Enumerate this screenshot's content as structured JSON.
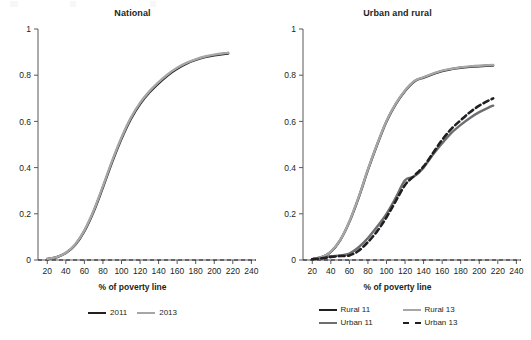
{
  "figure": {
    "background": "#ffffff",
    "text_color": "#231f20"
  },
  "panels": [
    {
      "id": "national",
      "title": "National",
      "xlabel": "% of poverty line",
      "legend": [
        {
          "label": "2011",
          "color": "#231f20",
          "style": "solid"
        },
        {
          "label": "2013",
          "color": "#a6a6a6",
          "style": "solid"
        }
      ]
    },
    {
      "id": "urban-and-rural",
      "title": "Urban and rural",
      "xlabel": "% of poverty line",
      "legend": [
        {
          "label": "Rural 11",
          "color": "#231f20",
          "style": "solid"
        },
        {
          "label": "Rural 13",
          "color": "#a6a6a6",
          "style": "solid"
        },
        {
          "label": "Urban 11",
          "color": "#6d6e71",
          "style": "solid"
        },
        {
          "label": "Urban 13",
          "color": "#231f20",
          "style": "dashed"
        }
      ]
    }
  ],
  "axes": {
    "x_ticks": [
      20,
      40,
      60,
      80,
      100,
      120,
      140,
      160,
      180,
      200,
      220,
      240
    ],
    "y_ticks": [
      "0",
      "0.2",
      "0.4",
      "0.6",
      "0.8",
      "1"
    ],
    "xlim": [
      10,
      245
    ],
    "ylim": [
      0,
      1
    ],
    "zero_reference_line": 0
  },
  "chart_data": [
    {
      "type": "line",
      "title": "National",
      "xlabel": "% of poverty line",
      "ylabel": "",
      "xlim": [
        10,
        245
      ],
      "ylim": [
        0,
        1
      ],
      "grid": false,
      "legend_position": "bottom",
      "x": [
        20,
        30,
        40,
        50,
        60,
        70,
        80,
        90,
        100,
        110,
        120,
        130,
        140,
        150,
        160,
        170,
        180,
        190,
        200,
        210,
        215
      ],
      "series": [
        {
          "name": "2011",
          "color": "#231f20",
          "style": "solid",
          "values": [
            0.005,
            0.012,
            0.03,
            0.065,
            0.125,
            0.21,
            0.315,
            0.425,
            0.525,
            0.61,
            0.675,
            0.725,
            0.765,
            0.8,
            0.828,
            0.85,
            0.866,
            0.878,
            0.886,
            0.892,
            0.894
          ]
        },
        {
          "name": "2013",
          "color": "#a6a6a6",
          "style": "solid",
          "values": [
            0.005,
            0.012,
            0.031,
            0.067,
            0.128,
            0.214,
            0.32,
            0.43,
            0.53,
            0.615,
            0.68,
            0.73,
            0.77,
            0.804,
            0.832,
            0.853,
            0.869,
            0.881,
            0.889,
            0.895,
            0.897
          ]
        }
      ]
    },
    {
      "type": "line",
      "title": "Urban and rural",
      "xlabel": "% of poverty line",
      "ylabel": "",
      "xlim": [
        10,
        245
      ],
      "ylim": [
        0,
        1
      ],
      "grid": false,
      "legend_position": "bottom",
      "x": [
        20,
        30,
        40,
        50,
        60,
        70,
        80,
        90,
        100,
        110,
        120,
        130,
        140,
        150,
        160,
        170,
        180,
        190,
        200,
        210,
        215
      ],
      "series": [
        {
          "name": "Rural 11",
          "color": "#231f20",
          "style": "solid",
          "values": [
            0.004,
            0.012,
            0.035,
            0.085,
            0.165,
            0.27,
            0.39,
            0.5,
            0.6,
            0.675,
            0.732,
            0.773,
            0.79,
            0.805,
            0.818,
            0.826,
            0.832,
            0.836,
            0.839,
            0.841,
            0.842
          ]
        },
        {
          "name": "Rural 13",
          "color": "#a6a6a6",
          "style": "solid",
          "values": [
            0.004,
            0.012,
            0.036,
            0.086,
            0.167,
            0.272,
            0.392,
            0.502,
            0.602,
            0.677,
            0.734,
            0.775,
            0.792,
            0.807,
            0.82,
            0.828,
            0.834,
            0.838,
            0.841,
            0.843,
            0.844
          ]
        },
        {
          "name": "Urban 11",
          "color": "#6d6e71",
          "style": "solid",
          "values": [
            0.003,
            0.008,
            0.016,
            0.02,
            0.028,
            0.055,
            0.095,
            0.145,
            0.2,
            0.27,
            0.345,
            0.362,
            0.4,
            0.455,
            0.505,
            0.55,
            0.585,
            0.615,
            0.64,
            0.66,
            0.668
          ]
        },
        {
          "name": "Urban 13",
          "color": "#231f20",
          "style": "dashed",
          "values": [
            0.003,
            0.007,
            0.013,
            0.017,
            0.02,
            0.04,
            0.078,
            0.125,
            0.185,
            0.255,
            0.325,
            0.365,
            0.405,
            0.462,
            0.52,
            0.568,
            0.605,
            0.64,
            0.668,
            0.69,
            0.7
          ]
        }
      ]
    }
  ]
}
